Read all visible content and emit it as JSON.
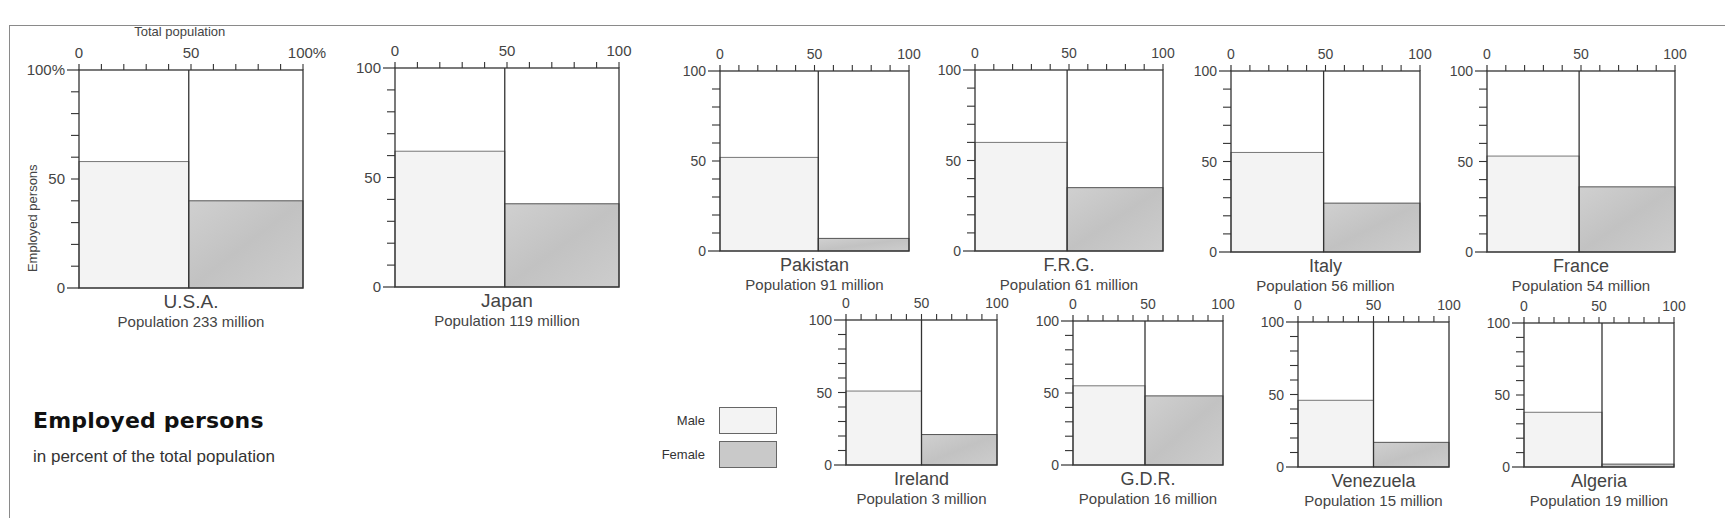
{
  "title": "Employed persons",
  "subtitle": "in percent of the total population",
  "legend": {
    "male_label": "Male",
    "female_label": "Female",
    "male_color": "#f3f3f3",
    "female_color": "#c9c9c9"
  },
  "axis_labels": {
    "x_top": "Total population",
    "y_left": "Employed persons"
  },
  "population_prefix": "Population",
  "chart_data": {
    "type": "bar",
    "title": "Employed persons",
    "subtitle": "in percent of the total population",
    "xlabel": "Total population",
    "ylabel": "Employed persons",
    "ylim": [
      0,
      100
    ],
    "xlim": [
      0,
      100
    ],
    "x_ticks": [
      "0",
      "50",
      "100"
    ],
    "y_ticks": [
      "0",
      "50",
      "100"
    ],
    "legend": [
      "Male",
      "Female"
    ],
    "legend_position": "bottom-center",
    "grid": false,
    "categories": [
      "U.S.A.",
      "Japan",
      "Pakistan",
      "F.R.G.",
      "Italy",
      "France",
      "Ireland",
      "G.D.R.",
      "Venezuela",
      "Algeria"
    ],
    "population_millions": [
      233,
      119,
      91,
      61,
      56,
      54,
      3,
      16,
      15,
      19
    ],
    "series": [
      {
        "name": "Male",
        "values": [
          58,
          62,
          52,
          60,
          55,
          53,
          51,
          55,
          46,
          38
        ]
      },
      {
        "name": "Female",
        "values": [
          40,
          38,
          7,
          35,
          27,
          36,
          21,
          48,
          17,
          2
        ]
      }
    ]
  },
  "panels": [
    {
      "country": "U.S.A.",
      "population": "233 million",
      "x": 79,
      "y": 70,
      "w": 224,
      "h": 218,
      "split": 0.49,
      "male": 58,
      "female": 40,
      "tick_max": "100%",
      "y_max": "100%",
      "first": true
    },
    {
      "country": "Japan",
      "population": "119 million",
      "x": 395,
      "y": 68,
      "w": 224,
      "h": 219,
      "split": 0.49,
      "male": 62,
      "female": 38,
      "tick_max": "100",
      "y_max": "100"
    },
    {
      "country": "Pakistan",
      "population": "91 million",
      "x": 720,
      "y": 71,
      "w": 189,
      "h": 180,
      "split": 0.52,
      "male": 52,
      "female": 7,
      "tick_max": "100",
      "y_max": "100"
    },
    {
      "country": "F.R.G.",
      "population": "61 million",
      "x": 975,
      "y": 70,
      "w": 188,
      "h": 181,
      "split": 0.49,
      "male": 60,
      "female": 35,
      "tick_max": "100",
      "y_max": "100"
    },
    {
      "country": "Italy",
      "population": "56 million",
      "x": 1231,
      "y": 71,
      "w": 189,
      "h": 181,
      "split": 0.49,
      "male": 55,
      "female": 27,
      "tick_max": "100",
      "y_max": "100"
    },
    {
      "country": "France",
      "population": "54 million",
      "x": 1487,
      "y": 71,
      "w": 188,
      "h": 181,
      "split": 0.49,
      "male": 53,
      "female": 36,
      "tick_max": "100",
      "y_max": "100"
    },
    {
      "country": "Ireland",
      "population": "3 million",
      "x": 846,
      "y": 320,
      "w": 151,
      "h": 145,
      "split": 0.5,
      "male": 51,
      "female": 21,
      "tick_max": "100",
      "y_max": "100"
    },
    {
      "country": "G.D.R.",
      "population": "16 million",
      "x": 1073,
      "y": 321,
      "w": 150,
      "h": 144,
      "split": 0.48,
      "male": 55,
      "female": 48,
      "tick_max": "100",
      "y_max": "100"
    },
    {
      "country": "Venezuela",
      "population": "15 million",
      "x": 1298,
      "y": 322,
      "w": 151,
      "h": 145,
      "split": 0.5,
      "male": 46,
      "female": 17,
      "tick_max": "100",
      "y_max": "100"
    },
    {
      "country": "Algeria",
      "population": "19 million",
      "x": 1524,
      "y": 323,
      "w": 150,
      "h": 144,
      "split": 0.52,
      "male": 38,
      "female": 2,
      "tick_max": "100",
      "y_max": "100"
    }
  ]
}
